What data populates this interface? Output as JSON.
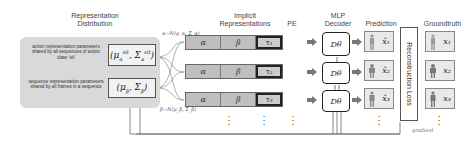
{
  "headers": {
    "representation_distribution": "Representation\nDistribution",
    "implicit_representations": "Implicit\nRepresentations",
    "pe": "PE",
    "mlp_decoder": "MLP\nDecoder",
    "prediction": "Prediction",
    "groundtruth": "Groundtruth"
  },
  "distribution_panel": {
    "action_text": "action representation parameters shared by all sequences of action class 'sit'",
    "sequence_text": "sequence representation parameters shared by all frames in a sequence",
    "action_params": "(μ_α^sit, Σ_α^sit)",
    "sequence_params": "(μ_β, Σ_β)"
  },
  "sampling": {
    "alpha_eq": "α~N(μ_α, Σ_α)",
    "beta_eq": "β~N(μ_β, Σ_β)"
  },
  "rows": [
    {
      "alpha": "α",
      "beta": "β",
      "tau": "τ₁",
      "decoder": "Dθ",
      "prediction": "x̂₁",
      "groundtruth": "x₁"
    },
    {
      "alpha": "α",
      "beta": "β",
      "tau": "τ₂",
      "decoder": "Dθ",
      "prediction": "x̂₂",
      "groundtruth": "x₂"
    },
    {
      "alpha": "α",
      "beta": "β",
      "tau": "τ₃",
      "decoder": "Dθ",
      "prediction": "x̂₃",
      "groundtruth": "x₃"
    }
  ],
  "ellipsis": "⋮",
  "loss_label": "Reconstruction Loss",
  "gradient_label": "gradient",
  "colors": {
    "panel_bg": "#d9d9d9",
    "cell_bg": "#bfbfbf",
    "image_bg": "#e9e9e9",
    "arrow": "#777777"
  }
}
